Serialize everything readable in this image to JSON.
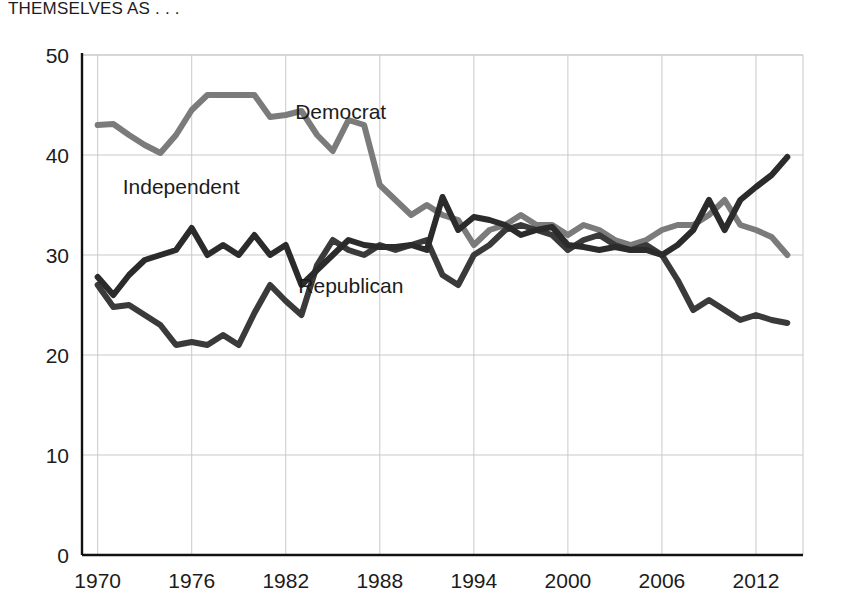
{
  "title": {
    "line1": "PERCENTAGE IDENTIFYING",
    "line2": "THEMSELVES AS . . ."
  },
  "colors": {
    "democrat": "#7b7b7b",
    "republican": "#3a3a3a",
    "independent": "#2b2b2b",
    "grid": "#c9c9c9",
    "axis": "#111111",
    "background": "#ffffff"
  },
  "annotations": [
    {
      "name": "democrat-label",
      "text": "Democrat",
      "x": 1982.6,
      "y": 43.6
    },
    {
      "name": "independent-label",
      "text": "Independent",
      "x": 1971.6,
      "y": 36.1
    },
    {
      "name": "republican-label",
      "text": "Republican",
      "x": 1982.8,
      "y": 26.2
    }
  ],
  "chart_data": {
    "type": "line",
    "title": "PERCENTAGE IDENTIFYING THEMSELVES AS . . .",
    "xlabel": "",
    "ylabel": "",
    "xlim": [
      1969,
      2015
    ],
    "ylim": [
      0,
      50
    ],
    "yticks": [
      0,
      10,
      20,
      30,
      40,
      50
    ],
    "xticks": [
      1970,
      1976,
      1982,
      1988,
      1994,
      2000,
      2006,
      2012
    ],
    "grid": true,
    "legend_position": "inline-annotations",
    "x": [
      1970,
      1971,
      1972,
      1973,
      1974,
      1975,
      1976,
      1977,
      1978,
      1979,
      1980,
      1981,
      1982,
      1983,
      1984,
      1985,
      1986,
      1987,
      1988,
      1989,
      1990,
      1991,
      1992,
      1993,
      1994,
      1995,
      1996,
      1997,
      1998,
      1999,
      2000,
      2001,
      2002,
      2003,
      2004,
      2005,
      2006,
      2007,
      2008,
      2009,
      2010,
      2011,
      2012,
      2013,
      2014
    ],
    "series": [
      {
        "name": "Democrat",
        "color": "#7b7b7b",
        "values": [
          43.0,
          43.1,
          42.0,
          41.0,
          40.2,
          42.0,
          44.5,
          46.0,
          46.0,
          46.0,
          46.0,
          43.8,
          44.0,
          44.4,
          42.0,
          40.4,
          43.5,
          43.0,
          37.0,
          35.5,
          34.0,
          35.0,
          34.0,
          33.5,
          31.0,
          32.5,
          33.0,
          34.0,
          33.0,
          33.0,
          32.0,
          33.0,
          32.5,
          31.5,
          31.0,
          31.5,
          32.5,
          33.0,
          33.0,
          34.0,
          35.5,
          33.0,
          32.5,
          31.8,
          30.0
        ]
      },
      {
        "name": "Republican",
        "color": "#3a3a3a",
        "values": [
          27.0,
          24.8,
          25.0,
          24.0,
          23.0,
          21.0,
          21.3,
          21.0,
          22.0,
          21.0,
          24.2,
          27.0,
          25.4,
          24.0,
          29.0,
          31.5,
          30.5,
          30.0,
          31.0,
          30.5,
          31.0,
          31.5,
          28.0,
          27.0,
          30.0,
          31.0,
          32.5,
          33.0,
          32.5,
          32.0,
          30.5,
          31.5,
          32.0,
          31.0,
          30.5,
          31.0,
          30.0,
          27.5,
          24.5,
          25.5,
          24.5,
          23.5,
          24.0,
          23.5,
          23.2
        ]
      },
      {
        "name": "Independent",
        "color": "#2b2b2b",
        "values": [
          27.8,
          26.0,
          28.0,
          29.5,
          30.0,
          30.5,
          32.7,
          30.0,
          31.0,
          30.0,
          32.0,
          30.0,
          31.0,
          27.0,
          28.5,
          30.0,
          31.5,
          31.0,
          30.8,
          30.8,
          31.0,
          30.5,
          35.8,
          32.5,
          33.8,
          33.5,
          33.0,
          32.0,
          32.5,
          32.8,
          31.0,
          30.8,
          30.5,
          30.8,
          30.5,
          30.5,
          30.0,
          31.0,
          32.5,
          35.5,
          32.5,
          35.5,
          36.8,
          38.0,
          39.8
        ]
      }
    ]
  }
}
